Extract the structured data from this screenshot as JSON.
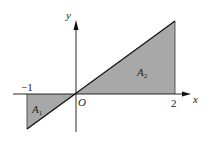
{
  "figure": {
    "type": "area-under-line diagram",
    "function": "y = k x",
    "axis_labels": {
      "x": "x",
      "y": "y",
      "origin": "O"
    },
    "tick_labels": {
      "neg_one": "−1",
      "two": "2"
    },
    "regions": [
      {
        "label": "A",
        "subscript": "1",
        "x_range": [
          -1,
          0
        ],
        "position": "below x-axis"
      },
      {
        "label": "A",
        "subscript": "2",
        "x_range": [
          0,
          2
        ],
        "position": "above x-axis"
      }
    ],
    "colors": {
      "fill": "#a8a8a8",
      "line": "#111111",
      "axis": "#111111"
    }
  }
}
